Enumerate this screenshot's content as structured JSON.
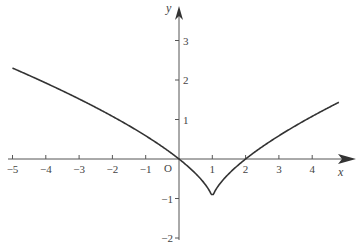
{
  "chart_data": {
    "type": "line",
    "title": "",
    "xlabel": "x",
    "ylabel": "y",
    "origin_label": "O",
    "xlim": [
      -5.2,
      5.4
    ],
    "ylim": [
      -2,
      3.6
    ],
    "grid": false,
    "legend": null,
    "x_ticks": [
      -5,
      -4,
      -3,
      -2,
      -1,
      1,
      2,
      3,
      4
    ],
    "x_tick_labels": [
      "−5",
      "−4",
      "−3",
      "−2",
      "−1",
      "1",
      "2",
      "3",
      "4"
    ],
    "y_ticks": [
      3,
      2,
      1,
      -1,
      -2
    ],
    "y_tick_labels": [
      "3",
      "2",
      "1",
      "−1",
      "−2"
    ],
    "series": [
      {
        "name": "curve",
        "color": "#333333",
        "x": [
          -5,
          -4.5,
          -4,
          -3.5,
          -3,
          -2.5,
          -2,
          -1.5,
          -1,
          -0.5,
          0,
          0.25,
          0.5,
          0.75,
          0.9,
          1,
          1.1,
          1.25,
          1.5,
          2,
          2.5,
          3,
          3.5,
          4,
          4.5,
          4.8
        ],
        "y": [
          2.3,
          2.12,
          1.92,
          1.73,
          1.52,
          1.31,
          1.08,
          0.84,
          0.59,
          0.31,
          0.0,
          -0.17,
          -0.37,
          -0.6,
          -0.78,
          -0.9,
          -0.78,
          -0.6,
          -0.37,
          0.0,
          0.31,
          0.59,
          0.84,
          1.08,
          1.31,
          1.43
        ]
      }
    ],
    "annotations": [
      {
        "text": "cusp minimum",
        "x": 1,
        "y": -0.9
      }
    ]
  },
  "caption": "Graph of y = ∛((x−1)²) − 1"
}
